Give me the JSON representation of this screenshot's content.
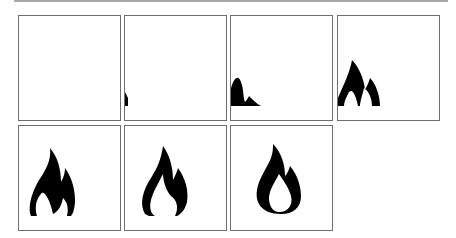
{
  "colors": {
    "border": "#6e6e6e",
    "flame": "#000000",
    "background": "#ffffff",
    "top_rule": "#a8a8a8"
  },
  "frames": [
    {
      "index": 1,
      "icon": "empty",
      "reveal": 0
    },
    {
      "index": 2,
      "icon": "flame-icon",
      "reveal": 0.1
    },
    {
      "index": 3,
      "icon": "flame-icon",
      "reveal": 0.35
    },
    {
      "index": 4,
      "icon": "flame-icon",
      "reveal": 0.7
    },
    {
      "index": 5,
      "icon": "flame-icon",
      "reveal": 1.0
    },
    {
      "index": 6,
      "icon": "flame-icon",
      "reveal": 1.0
    },
    {
      "index": 7,
      "icon": "flame-icon-with-core",
      "reveal": 1.0
    }
  ]
}
